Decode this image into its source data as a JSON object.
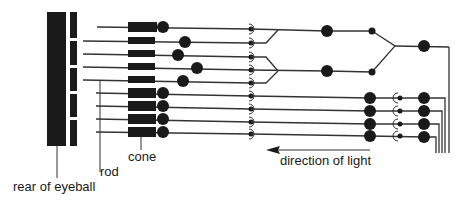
{
  "diagram": {
    "labels": {
      "rear": "rear of eyeball",
      "rod": "rod",
      "cone": "cone",
      "light": "direction of light"
    },
    "colors": {
      "ink": "#1a1a1a",
      "line": "#333333",
      "background": "#ffffff"
    },
    "rows": [
      {
        "y": 27,
        "type": "cone-rod",
        "line_start": 97,
        "soma_x": 163
      },
      {
        "y": 41,
        "type": "rod",
        "line_start": 83,
        "soma_x": 185
      },
      {
        "y": 54,
        "type": "rod",
        "line_start": 83,
        "soma_x": 178
      },
      {
        "y": 67,
        "type": "rod",
        "line_start": 83,
        "soma_x": 197
      },
      {
        "y": 80,
        "type": "rod",
        "line_start": 83,
        "soma_x": 183
      },
      {
        "y": 93,
        "type": "cone",
        "line_start": 96,
        "soma_x": 163
      },
      {
        "y": 106,
        "type": "cone",
        "line_start": 96,
        "soma_x": 163
      },
      {
        "y": 119,
        "type": "cone",
        "line_start": 96,
        "soma_x": 163
      },
      {
        "y": 132,
        "type": "cone",
        "line_start": 96,
        "soma_x": 163
      }
    ]
  }
}
